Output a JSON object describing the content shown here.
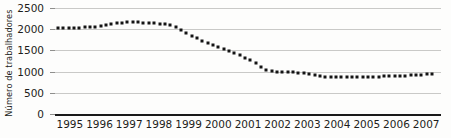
{
  "chart_data": {
    "type": "scatter",
    "title": "",
    "xlabel": "",
    "ylabel": "Número de trabalhadores",
    "xlim": [
      1995,
      2008
    ],
    "ylim": [
      0,
      2500
    ],
    "grid": true,
    "legend": null,
    "marker": "square",
    "marker_color": "#141414",
    "gridline_color": "#c9c9c7",
    "axis_color": "#1a1a1a",
    "background": "#fdfdfc",
    "yticks": [
      0,
      500,
      1000,
      1500,
      2000,
      2500
    ],
    "ytick_labels": [
      "0",
      "500",
      "1000",
      "1500",
      "2000",
      "2500"
    ],
    "xticks": [
      1995,
      1996,
      1997,
      1998,
      1999,
      2000,
      2001,
      2002,
      2003,
      2004,
      2005,
      2006,
      2007
    ],
    "xtick_labels": [
      "1995",
      "1996",
      "1997",
      "1998",
      "1999",
      "2000",
      "2001",
      "2002",
      "2003",
      "2004",
      "2005",
      "2006",
      "2007"
    ],
    "series": [
      {
        "name": "Número de trabalhadores",
        "x": [
          1995.1,
          1995.28,
          1995.46,
          1995.64,
          1995.82,
          1996.0,
          1996.18,
          1996.36,
          1996.54,
          1996.72,
          1996.9,
          1997.08,
          1997.26,
          1997.44,
          1997.62,
          1997.8,
          1997.98,
          1998.16,
          1998.34,
          1998.52,
          1998.7,
          1998.88,
          1999.06,
          1999.24,
          1999.42,
          1999.6,
          1999.78,
          1999.96,
          2000.14,
          2000.32,
          2000.5,
          2000.68,
          2000.86,
          2001.04,
          2001.22,
          2001.4,
          2001.58,
          2001.76,
          2001.94,
          2002.12,
          2002.3,
          2002.48,
          2002.66,
          2002.84,
          2003.02,
          2003.2,
          2003.38,
          2003.56,
          2003.74,
          2003.92,
          2004.1,
          2004.28,
          2004.46,
          2004.64,
          2004.82,
          2005.0,
          2005.18,
          2005.36,
          2005.54,
          2005.72,
          2005.9,
          2006.08,
          2006.26,
          2006.44,
          2006.62,
          2006.8,
          2006.98,
          2007.16,
          2007.34,
          2007.52,
          2007.7
        ],
        "y": [
          2030,
          2030,
          2035,
          2035,
          2040,
          2045,
          2050,
          2060,
          2075,
          2095,
          2115,
          2135,
          2155,
          2165,
          2170,
          2165,
          2155,
          2145,
          2135,
          2130,
          2120,
          2100,
          2050,
          1985,
          1915,
          1850,
          1790,
          1730,
          1680,
          1630,
          1580,
          1530,
          1480,
          1430,
          1380,
          1330,
          1270,
          1200,
          1110,
          1040,
          1010,
          1000,
          995,
          990,
          985,
          975,
          960,
          935,
          910,
          890,
          875,
          868,
          865,
          865,
          868,
          870,
          872,
          875,
          878,
          880,
          882,
          885,
          888,
          892,
          898,
          905,
          912,
          920,
          930,
          940,
          948
        ]
      }
    ]
  }
}
